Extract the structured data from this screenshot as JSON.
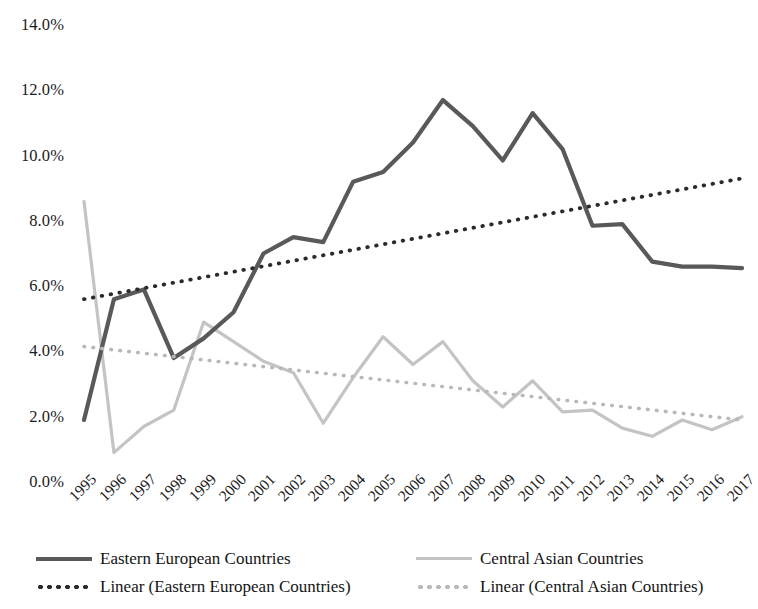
{
  "chart_data": {
    "type": "line",
    "title": "",
    "subtitle": "",
    "xlabel": "",
    "ylabel": "",
    "grid": false,
    "legend_position": "bottom",
    "categories": [
      "1995",
      "1996",
      "1997",
      "1998",
      "1999",
      "2000",
      "2001",
      "2002",
      "2003",
      "2004",
      "2005",
      "2006",
      "2007",
      "2008",
      "2009",
      "2010",
      "2011",
      "2012",
      "2013",
      "2014",
      "2015",
      "2016",
      "2017"
    ],
    "ylim": [
      0,
      14
    ],
    "y_tick_labels": [
      "14.0%",
      "12.0%",
      "10.0%",
      "8.0%",
      "6.0%",
      "4.0%",
      "2.0%",
      "0.0%"
    ],
    "y_tick_values": [
      14,
      12,
      10,
      8,
      6,
      4,
      2,
      0
    ],
    "y_unit": "%",
    "series": [
      {
        "name": "Eastern European Countries",
        "style": "solid",
        "color": "#595959",
        "values": [
          1.9,
          5.6,
          5.9,
          3.8,
          4.4,
          5.2,
          7.0,
          7.5,
          7.35,
          9.2,
          9.5,
          10.4,
          11.7,
          10.9,
          9.85,
          11.3,
          10.2,
          7.85,
          7.9,
          6.75,
          6.6,
          6.6,
          6.55
        ]
      },
      {
        "name": "Central Asian Countries",
        "style": "solid",
        "color": "#c4c4c4",
        "values": [
          8.6,
          0.9,
          1.7,
          2.2,
          4.9,
          4.3,
          3.7,
          3.35,
          1.8,
          3.2,
          4.45,
          3.6,
          4.3,
          3.1,
          2.3,
          3.1,
          2.15,
          2.2,
          1.65,
          1.4,
          1.9,
          1.6,
          2.0
        ]
      },
      {
        "name": "Linear (Eastern European Countries)",
        "style": "dotted",
        "color": "#2b2b2b",
        "trendline_for": "Eastern European Countries",
        "endpoints": [
          5.6,
          9.3
        ]
      },
      {
        "name": "Linear (Central Asian Countries)",
        "style": "dotted",
        "color": "#b9b9b9",
        "trendline_for": "Central Asian Countries",
        "endpoints": [
          4.15,
          1.9
        ]
      }
    ]
  },
  "legend": {
    "items": [
      {
        "label": "Eastern European Countries",
        "swatch": "solid-dark"
      },
      {
        "label": "Central Asian Countries",
        "swatch": "solid-light"
      },
      {
        "label": "Linear (Eastern European Countries)",
        "swatch": "dotted-dark"
      },
      {
        "label": "Linear (Central Asian Countries)",
        "swatch": "dotted-light"
      }
    ]
  }
}
